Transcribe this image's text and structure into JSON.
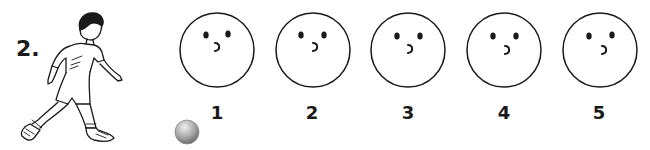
{
  "question": {
    "number_label": "2.",
    "illustration": "boy-kicking-ball",
    "ball": {
      "icon": "ball-icon",
      "color_light": "#e0e0e0",
      "color_dark": "#7a7a7a"
    }
  },
  "faces": [
    {
      "label": "1",
      "expression": "surprised-o-mouth"
    },
    {
      "label": "2",
      "expression": "surprised-o-mouth"
    },
    {
      "label": "3",
      "expression": "surprised-o-mouth"
    },
    {
      "label": "4",
      "expression": "surprised-o-mouth"
    },
    {
      "label": "5",
      "expression": "surprised-o-mouth"
    }
  ],
  "colors": {
    "ink": "#1a1a1a",
    "background": "#ffffff"
  }
}
